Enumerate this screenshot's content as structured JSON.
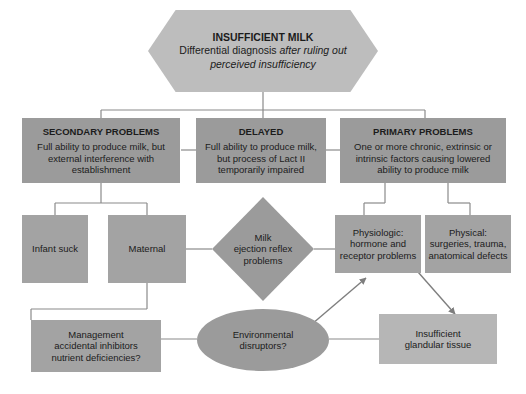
{
  "diagram": {
    "type": "flowchart",
    "colors": {
      "root_fill": "#bdbdbd",
      "level2_fill": "#9b9b9b",
      "level3_fill": "#a3a3a3",
      "light_fill": "#bcbcbc",
      "connector": "#8a8a8a",
      "text": "#1b1b1b",
      "background": "#ffffff"
    },
    "root": {
      "shape": "hexagon",
      "title": "INSUFFICIENT MILK",
      "line1": "Differential diagnosis",
      "line1_italic": "after ruling out",
      "line2_italic": "perceived insufficiency"
    },
    "branches": [
      {
        "id": "secondary",
        "shape": "rectangle",
        "title": "SECONDARY PROBLEMS",
        "body": "Full ability to produce milk, but external interference with establishment"
      },
      {
        "id": "delayed",
        "shape": "rectangle",
        "title": "DELAYED",
        "body": "Full ability to produce milk, but process of Lact II temporarily impaired"
      },
      {
        "id": "primary",
        "shape": "rectangle",
        "title": "PRIMARY PROBLEMS",
        "body": "One or more chronic, extrinsic or intrinsic factors causing lowered ability to produce milk"
      }
    ],
    "nodes": {
      "infant_suck": {
        "shape": "rectangle",
        "label": "Infant suck"
      },
      "maternal": {
        "shape": "rectangle",
        "label": "Maternal"
      },
      "milk_ejection": {
        "shape": "diamond",
        "line1": "Milk",
        "line2": "ejection reflex",
        "line3": "problems"
      },
      "physiologic": {
        "shape": "rectangle",
        "line1": "Physiologic:",
        "line2": "hormone and",
        "line3": "receptor problems"
      },
      "physical": {
        "shape": "rectangle",
        "line1": "Physical:",
        "line2": "surgeries, trauma,",
        "line3": "anatomical defects"
      },
      "management": {
        "shape": "rectangle",
        "line1": "Management",
        "line2": "accidental inhibitors",
        "line3": "nutrient deficiencies?"
      },
      "environmental": {
        "shape": "ellipse",
        "line1": "Environmental",
        "line2": "disruptors?"
      },
      "insufficient_glandular": {
        "shape": "rectangle",
        "line1": "Insufficient",
        "line2": "glandular tissue"
      }
    }
  }
}
